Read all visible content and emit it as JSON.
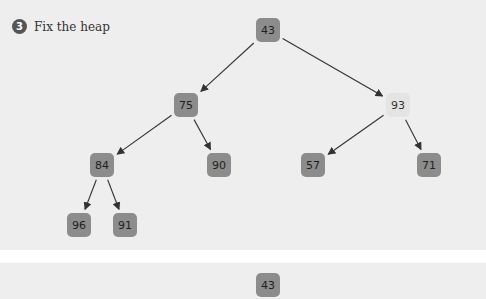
{
  "step": {
    "number": "3",
    "title": "Fix the heap"
  },
  "colors": {
    "node_dark": "#8c8c8c",
    "node_light": "#e4e4e4",
    "panel_bg": "#eeeeee",
    "edge": "#333333"
  },
  "tree": {
    "nodes": [
      {
        "id": "n0",
        "value": "43",
        "x": 268,
        "y": 30,
        "style": "dark"
      },
      {
        "id": "n1",
        "value": "75",
        "x": 186,
        "y": 105,
        "style": "dark"
      },
      {
        "id": "n2",
        "value": "93",
        "x": 398,
        "y": 105,
        "style": "light"
      },
      {
        "id": "n3",
        "value": "84",
        "x": 102,
        "y": 165,
        "style": "dark"
      },
      {
        "id": "n4",
        "value": "90",
        "x": 219,
        "y": 165,
        "style": "dark"
      },
      {
        "id": "n5",
        "value": "57",
        "x": 313,
        "y": 165,
        "style": "dark"
      },
      {
        "id": "n6",
        "value": "71",
        "x": 429,
        "y": 165,
        "style": "dark"
      },
      {
        "id": "n7",
        "value": "96",
        "x": 79,
        "y": 225,
        "style": "dark"
      },
      {
        "id": "n8",
        "value": "91",
        "x": 125,
        "y": 225,
        "style": "dark"
      }
    ],
    "edges": [
      [
        "n0",
        "n1"
      ],
      [
        "n0",
        "n2"
      ],
      [
        "n1",
        "n3"
      ],
      [
        "n1",
        "n4"
      ],
      [
        "n2",
        "n5"
      ],
      [
        "n2",
        "n6"
      ],
      [
        "n3",
        "n7"
      ],
      [
        "n3",
        "n8"
      ]
    ]
  },
  "next_panel": {
    "root_value": "43"
  }
}
